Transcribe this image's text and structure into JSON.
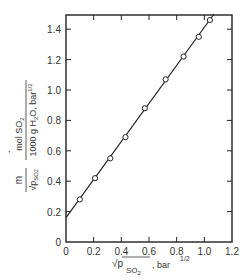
{
  "chart_data": {
    "type": "scatter",
    "title": "",
    "xlabel": "√p_SO2 , bar^1/2",
    "ylabel": "m/√p_SO2 , mol SO2 / (1000 g H2O, bar^1/2)",
    "xlim": [
      0,
      1.2
    ],
    "ylim": [
      0,
      1.5
    ],
    "x_ticks": [
      "0",
      "0.2",
      "0.4",
      "0.6",
      "0.8",
      "1.0",
      "1.2"
    ],
    "y_ticks": [
      "0",
      "0.2",
      "0.4",
      "0.6",
      "0.8",
      "1.0",
      "1.2",
      "1.4"
    ],
    "grid": false,
    "legend": null,
    "series": [
      {
        "name": "data",
        "marker": "open-circle",
        "x": [
          0.1,
          0.21,
          0.32,
          0.43,
          0.57,
          0.72,
          0.85,
          0.96,
          1.04
        ],
        "y": [
          0.28,
          0.42,
          0.55,
          0.69,
          0.88,
          1.07,
          1.22,
          1.35,
          1.46
        ]
      },
      {
        "name": "linear fit",
        "type": "line",
        "x": [
          0,
          1.07
        ],
        "y": [
          0.16,
          1.5
        ]
      }
    ]
  },
  "axis": {
    "x_label_main": "√p",
    "x_label_sub": "SO",
    "x_label_sub2": "2",
    "x_label_unit": ", bar",
    "x_label_exp": "1/2",
    "y_label_num": "mol SO",
    "y_label_num_sub": "2",
    "y_label_den": "1000 g H",
    "y_label_den_sub": "2",
    "y_label_den_rest": "O, bar",
    "y_label_den_exp": "1/2",
    "y_label_m": "m",
    "y_label_sqrt": "√p",
    "y_label_sqrt_sub": "SO",
    "y_label_sqrt_sub2": "2"
  }
}
